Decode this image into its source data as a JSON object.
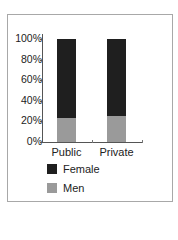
{
  "chart_data": {
    "type": "bar",
    "stacked": true,
    "title": "",
    "xlabel": "",
    "ylabel": "",
    "categories": [
      "Public",
      "Private"
    ],
    "series": [
      {
        "name": "Men",
        "values": [
          23,
          25
        ],
        "color": "#9a9a9a"
      },
      {
        "name": "Female",
        "values": [
          77,
          75
        ],
        "color": "#1f1f1f"
      }
    ],
    "y_ticks": [
      "0%",
      "20%",
      "40%",
      "60%",
      "80%",
      "100%"
    ],
    "ylim": [
      0,
      100
    ],
    "grid": false,
    "legend_position": "bottom"
  },
  "legend": {
    "female_label": "Female",
    "men_label": "Men"
  }
}
